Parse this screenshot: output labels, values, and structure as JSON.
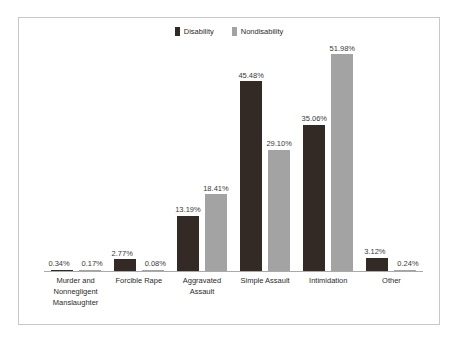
{
  "chart_data": {
    "type": "bar",
    "title": "",
    "subtitle": "",
    "xlabel": "",
    "ylabel": "",
    "grid": false,
    "legend_position": "top-center",
    "ylim": [
      0,
      51.98
    ],
    "categories": [
      "Murder and Nonnegligent Manslaughter",
      "Forcible Rape",
      "Aggravated Assault",
      "Simple Assault",
      "Intimidation",
      "Other"
    ],
    "category_lines": [
      [
        "Murder and",
        "Nonnegligent",
        "Manslaughter"
      ],
      [
        "Forcible Rape"
      ],
      [
        "Aggravated Assault"
      ],
      [
        "Simple Assault"
      ],
      [
        "Intimidation"
      ],
      [
        "Other"
      ]
    ],
    "series": [
      {
        "name": "Disability",
        "color": "#332a26",
        "values": [
          0.34,
          2.77,
          13.19,
          45.48,
          35.06,
          3.12
        ],
        "labels": [
          "0.34%",
          "2.77%",
          "13.19%",
          "45.48%",
          "35.06%",
          "3.12%"
        ]
      },
      {
        "name": "Nondisability",
        "color": "#a3a3a3",
        "values": [
          0.17,
          0.08,
          18.41,
          29.1,
          51.98,
          0.24
        ],
        "labels": [
          "0.17%",
          "0.08%",
          "18.41%",
          "29.10%",
          "51.98%",
          "0.24%"
        ]
      }
    ]
  },
  "legend": {
    "items": [
      {
        "label": "Disability",
        "color": "#332a26"
      },
      {
        "label": "Nondisability",
        "color": "#a3a3a3"
      }
    ]
  }
}
